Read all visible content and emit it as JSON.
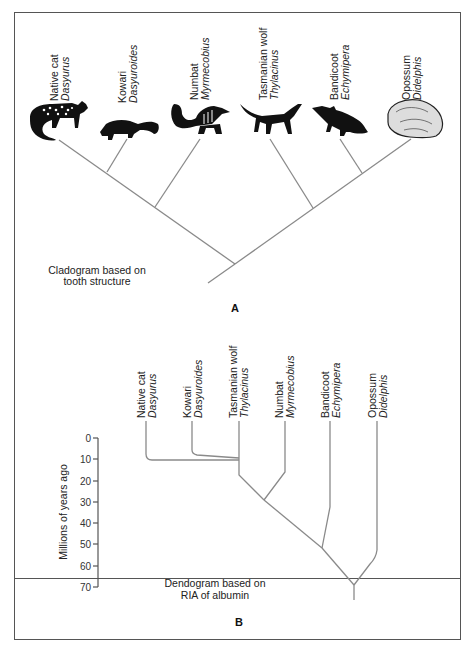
{
  "cladogram": {
    "panel_label": "A",
    "caption_line1": "Cladogram based on",
    "caption_line2": "tooth structure",
    "taxa": [
      {
        "common": "Native cat",
        "genus": "Dasyurus",
        "icon": "native-cat-illustration"
      },
      {
        "common": "Kowari",
        "genus": "Dasyuroides",
        "icon": "kowari-illustration"
      },
      {
        "common": "Numbat",
        "genus": "Myrmecobius",
        "icon": "numbat-illustration"
      },
      {
        "common": "Tasmanian wolf",
        "genus": "Thylacinus",
        "icon": "tasmanian-wolf-illustration"
      },
      {
        "common": "Bandicoot",
        "genus": "Echymipera",
        "icon": "bandicoot-illustration"
      },
      {
        "common": "Opossum",
        "genus": "Didelphis",
        "icon": "opossum-illustration"
      }
    ]
  },
  "dendrogram": {
    "panel_label": "B",
    "caption_line1": "Dendogram based on",
    "caption_line2": "RIA of albumin",
    "ylabel": "Millions of years ago",
    "ticks": [
      "0",
      "10",
      "20",
      "30",
      "40",
      "50",
      "60",
      "70"
    ],
    "taxa": [
      {
        "common": "Native cat",
        "genus": "Dasyurus"
      },
      {
        "common": "Kowari",
        "genus": "Dasyuroides"
      },
      {
        "common": "Tasmanian wolf",
        "genus": "Thylacinus"
      },
      {
        "common": "Numbat",
        "genus": "Myrmecobius"
      },
      {
        "common": "Bandicoot",
        "genus": "Echymipera"
      },
      {
        "common": "Opossum",
        "genus": "Didelphis"
      }
    ]
  },
  "colors": {
    "line": "#8a8a8a",
    "frame": "#555555",
    "text": "#222222"
  }
}
